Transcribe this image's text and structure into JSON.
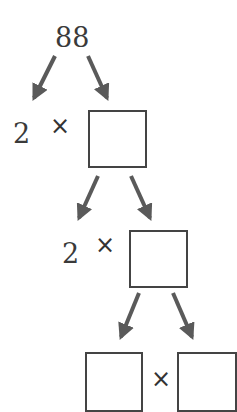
{
  "diagram": {
    "type": "factor-tree",
    "root": "88",
    "level1": {
      "factor": "2",
      "operator": "×",
      "box": ""
    },
    "level2": {
      "factor": "2",
      "operator": "×",
      "box": ""
    },
    "level3": {
      "left_box": "",
      "operator": "×",
      "right_box": ""
    }
  },
  "colors": {
    "arrow": "#5a5a5a",
    "box_border": "#444444",
    "text": "#3a3a3a"
  }
}
